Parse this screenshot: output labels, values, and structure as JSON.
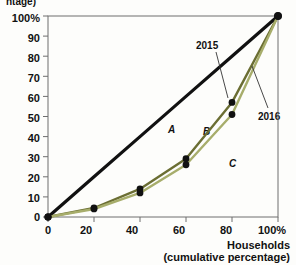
{
  "chart_data": {
    "type": "line",
    "title": "",
    "xlabel_line1": "Households",
    "xlabel_line2": "(cumulative percentage)",
    "ylabel_clipped": "ntage)",
    "x": [
      0,
      20,
      40,
      60,
      80,
      100
    ],
    "xticks": [
      "0",
      "20",
      "40",
      "60",
      "80",
      "100%"
    ],
    "yticks": [
      "0",
      "10",
      "20",
      "30",
      "40",
      "50",
      "60",
      "70",
      "80",
      "90",
      "100%"
    ],
    "xlim": [
      0,
      100
    ],
    "ylim": [
      0,
      100
    ],
    "grid": false,
    "legend_position": "inline-annotation",
    "series": [
      {
        "name": "Line of equality",
        "values": [
          0,
          20,
          40,
          60,
          80,
          100
        ],
        "color": "#111111",
        "markers": false
      },
      {
        "name": "2015",
        "values": [
          0,
          4.5,
          14,
          29,
          57,
          100
        ],
        "color": "#6b6e33",
        "markers": true
      },
      {
        "name": "2016",
        "values": [
          0,
          4.0,
          12,
          26,
          51,
          100
        ],
        "color": "#a7ad6b",
        "markers": true
      }
    ],
    "annotations": [
      {
        "text": "A",
        "x": 55,
        "y": 46
      },
      {
        "text": "B",
        "x": 70,
        "y": 44
      },
      {
        "text": "C",
        "x": 80,
        "y": 26
      },
      {
        "text": "2015",
        "x": 63,
        "y": 84
      },
      {
        "text": "2016",
        "x": 92,
        "y": 55
      }
    ]
  },
  "axis": {
    "x_label_line1": "Households",
    "x_label_line2": "(cumulative percentage)",
    "y_label_top_clipped": "ntage)"
  },
  "ticks": {
    "y": [
      "100%",
      "90",
      "80",
      "70",
      "60",
      "50",
      "40",
      "30",
      "20",
      "10",
      "0"
    ],
    "x": [
      "0",
      "20",
      "40",
      "60",
      "80",
      "100%"
    ]
  },
  "annotations": {
    "a": "A",
    "b": "B",
    "c": "C",
    "year_2015": "2015",
    "year_2016": "2016"
  },
  "colors": {
    "equality_line": "#111111",
    "curve_2015": "#6b6e33",
    "curve_2016": "#a7ad6b",
    "axis": "#6e6e6e",
    "marker": "#111111",
    "background": "#fdfdfb"
  }
}
